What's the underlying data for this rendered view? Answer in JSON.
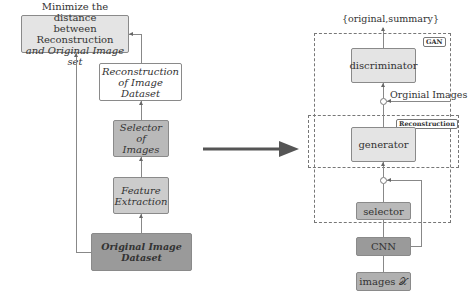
{
  "left_flow": {
    "minimize": {
      "line1": "Minimize the distance",
      "line2": "between Reconstruction",
      "line3": "and Original Image set"
    },
    "reconstruction": {
      "line1": "Reconstruction",
      "line2": "of Image Dataset"
    },
    "selector": {
      "line1": "Selector of",
      "line2": "Images"
    },
    "feature": {
      "line1": "Feature",
      "line2": "Extraction"
    },
    "original": {
      "label": "Original Image Dataset"
    }
  },
  "transition_arrow": "right-arrow",
  "right_flow": {
    "output_label": "{original,summary}",
    "gan_tag": "GAN",
    "reconstruction_tag": "Reconstruction",
    "discriminator": "discriminator",
    "original_images_label": "Orginial Images",
    "generator": "generator",
    "selector": "selector",
    "cnn": "CNN",
    "images": "images 𝒳"
  },
  "colors": {
    "light_box": "#e4e4e4",
    "white_box": "#ffffff",
    "mid_box": "#b9b9b9",
    "light_mid_box": "#cccccc",
    "dark_box": "#9a9a9a",
    "arrow": "#555555"
  }
}
